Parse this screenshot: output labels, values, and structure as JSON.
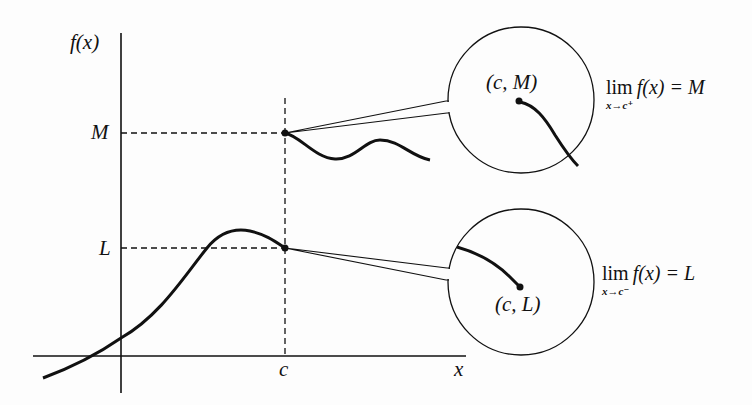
{
  "figure": {
    "axes": {
      "y_label": "f(x)",
      "x_label": "x",
      "x_tick_label": "c",
      "y_tick_labels": {
        "upper": "M",
        "lower": "L"
      }
    },
    "callouts": {
      "upper": {
        "point_label": "(c, M)",
        "limit_expr": "lim f(x) = M",
        "limit_word": "lim",
        "limit_rhs": "f(x) = M",
        "limit_sub": "x→c⁺"
      },
      "lower": {
        "point_label": "(c, L)",
        "limit_expr": "lim f(x) = L",
        "limit_word": "lim",
        "limit_rhs": "f(x) = L",
        "limit_sub": "x→c⁻"
      }
    },
    "colors": {
      "ink": "#111111",
      "background": "#fdfdfd"
    }
  }
}
